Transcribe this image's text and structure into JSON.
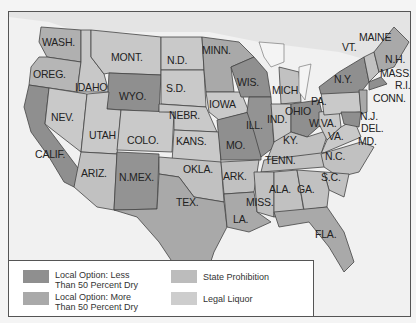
{
  "colors": {
    "less_than_50_dry": "#8f8f8f",
    "more_than_50_dry": "#a9a9a9",
    "state_prohibition": "#bcbcbc",
    "legal_liquor": "#cdcdcd",
    "water": "#f1f1f1",
    "border": "#444444"
  },
  "states": {
    "wash": "WASH.",
    "oreg": "OREG.",
    "calif": "CALIF.",
    "idaho": "IDAHO",
    "nev": "NEV.",
    "mont": "MONT.",
    "wyo": "WYO.",
    "utah": "UTAH",
    "ariz": "ARIZ.",
    "colo": "COLO.",
    "nmex": "N.MEX.",
    "nd": "N.D.",
    "sd": "S.D.",
    "nebr": "NEBR.",
    "kans": "KANS.",
    "okla": "OKLA.",
    "tex": "TEX.",
    "minn": "MINN.",
    "iowa": "IOWA",
    "mo": "MO.",
    "ark": "ARK.",
    "la": "LA.",
    "wis": "WIS.",
    "ill": "ILL.",
    "mich": "MICH",
    "ind": "IND.",
    "ohio": "OHIO",
    "ky": "KY.",
    "tenn": "TENN.",
    "miss": "MISS.",
    "ala": "ALA.",
    "ga": "GA.",
    "fla": "FLA.",
    "sc": "S.C.",
    "nc": "N.C.",
    "va": "VA.",
    "wva": "W.VA.",
    "pa": "PA.",
    "ny": "N.Y.",
    "vt": "VT.",
    "maine": "MAINE",
    "nh": "N.H.",
    "mass": "MASS.",
    "ri": "R.I.",
    "conn": "CONN.",
    "nj": "N.J.",
    "del": "DEL.",
    "md": "MD."
  },
  "legend": {
    "items": [
      {
        "label": "Local Option: Less Than 50 Percent Dry"
      },
      {
        "label": "Local Option: More Than 50 Percent Dry"
      },
      {
        "label": "State Prohibition"
      },
      {
        "label": "Legal Liquor"
      }
    ]
  }
}
